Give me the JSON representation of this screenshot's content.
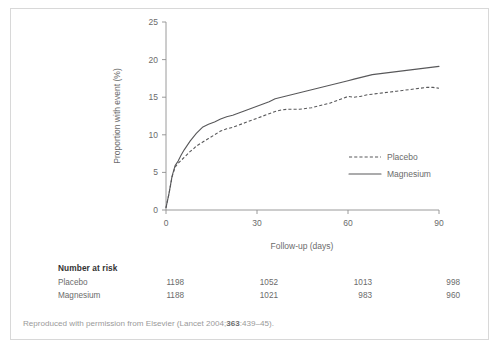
{
  "figure": {
    "footer_prefix": "Reproduced with permission from Elsevier (Lancet 2004;",
    "footer_bold": "363",
    "footer_suffix": ":439–45).",
    "top_cutoff_text": ""
  },
  "risk_table": {
    "title": "Number at risk",
    "rows": [
      {
        "name": "Placebo",
        "values": [
          "1198",
          "1052",
          "1013",
          "998"
        ]
      },
      {
        "name": "Magnesium",
        "values": [
          "1188",
          "1021",
          "983",
          "960"
        ]
      }
    ]
  },
  "chart_data": {
    "type": "line",
    "title": "",
    "subtitle": "",
    "xlabel": "Follow-up (days)",
    "ylabel": "Proportion with event (%)",
    "xlim": [
      0,
      90
    ],
    "ylim": [
      0,
      25
    ],
    "xticks": [
      0,
      30,
      60,
      90
    ],
    "yticks": [
      0,
      5,
      10,
      15,
      20,
      25
    ],
    "xtick_labels": [
      "0",
      "30",
      "60",
      "90"
    ],
    "ytick_labels": [
      "0",
      "5",
      "10",
      "15",
      "20",
      "25"
    ],
    "grid": false,
    "legend_position": "center-right",
    "series": [
      {
        "name": "Placebo",
        "style": "dashed",
        "color": "#58585a",
        "x": [
          0,
          1,
          2,
          3,
          4,
          5,
          6,
          7,
          8,
          9,
          10,
          12,
          14,
          16,
          18,
          20,
          22,
          24,
          26,
          28,
          30,
          32,
          34,
          36,
          38,
          40,
          42,
          44,
          46,
          48,
          50,
          52,
          54,
          56,
          58,
          60,
          62,
          64,
          66,
          68,
          70,
          72,
          74,
          76,
          78,
          80,
          82,
          84,
          86,
          88,
          90
        ],
        "y": [
          0.3,
          2.2,
          4.4,
          5.7,
          6.2,
          6.6,
          7.0,
          7.4,
          7.8,
          8.1,
          8.5,
          9.0,
          9.5,
          10.0,
          10.5,
          10.8,
          11.0,
          11.3,
          11.6,
          11.9,
          12.2,
          12.5,
          12.8,
          13.1,
          13.3,
          13.4,
          13.4,
          13.4,
          13.5,
          13.6,
          13.8,
          14.0,
          14.2,
          14.5,
          14.8,
          15.1,
          15.0,
          15.1,
          15.3,
          15.4,
          15.5,
          15.6,
          15.7,
          15.8,
          15.9,
          16.0,
          16.1,
          16.2,
          16.3,
          16.3,
          16.2
        ]
      },
      {
        "name": "Magnesium",
        "style": "solid",
        "color": "#58585a",
        "x": [
          0,
          1,
          2,
          3,
          4,
          5,
          6,
          7,
          8,
          9,
          10,
          12,
          14,
          16,
          18,
          20,
          22,
          24,
          26,
          28,
          30,
          32,
          34,
          36,
          38,
          40,
          42,
          44,
          46,
          48,
          50,
          52,
          54,
          56,
          58,
          60,
          62,
          64,
          66,
          68,
          70,
          72,
          74,
          76,
          78,
          80,
          82,
          84,
          86,
          88,
          90
        ],
        "y": [
          0.3,
          2.2,
          4.5,
          5.9,
          6.5,
          7.3,
          8.0,
          8.6,
          9.2,
          9.7,
          10.2,
          11.0,
          11.4,
          11.7,
          12.1,
          12.4,
          12.6,
          12.9,
          13.2,
          13.5,
          13.8,
          14.1,
          14.4,
          14.8,
          15.0,
          15.2,
          15.4,
          15.6,
          15.8,
          16.0,
          16.2,
          16.4,
          16.6,
          16.8,
          17.0,
          17.2,
          17.4,
          17.6,
          17.8,
          18.0,
          18.1,
          18.2,
          18.3,
          18.4,
          18.5,
          18.6,
          18.7,
          18.8,
          18.9,
          19.0,
          19.1
        ]
      }
    ],
    "annotations": []
  }
}
